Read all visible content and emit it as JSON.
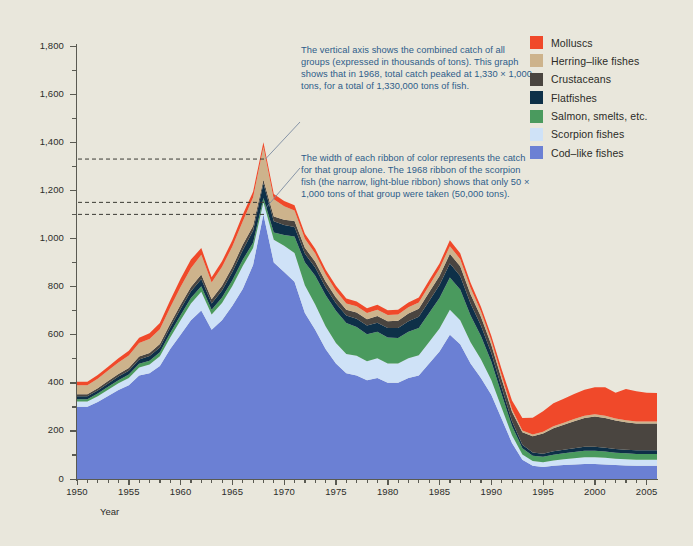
{
  "chart_data": {
    "type": "area",
    "stacked": true,
    "title": "",
    "xlabel": "Year",
    "ylabel": "Catch (tons x 1,000)",
    "xlim": [
      1950,
      2006
    ],
    "ylim": [
      0,
      1800
    ],
    "ytick_labels": [
      "0",
      "200",
      "400",
      "600",
      "800",
      "1,000",
      "1,200",
      "1,400",
      "1,600",
      "1,800"
    ],
    "yticks": [
      0,
      200,
      400,
      600,
      800,
      1000,
      1200,
      1400,
      1600,
      1800
    ],
    "xtick_labels": [
      "1950",
      "1955",
      "1960",
      "1965",
      "1970",
      "1975",
      "1980",
      "1985",
      "1990",
      "1995",
      "2000",
      "2005"
    ],
    "xticks": [
      1950,
      1955,
      1960,
      1965,
      1970,
      1975,
      1980,
      1985,
      1990,
      1995,
      2000,
      2005
    ],
    "grid": false,
    "legend_position": "right",
    "x": [
      1950,
      1951,
      1952,
      1953,
      1954,
      1955,
      1956,
      1957,
      1958,
      1959,
      1960,
      1961,
      1962,
      1963,
      1964,
      1965,
      1966,
      1967,
      1968,
      1969,
      1970,
      1971,
      1972,
      1973,
      1974,
      1975,
      1976,
      1977,
      1978,
      1979,
      1980,
      1981,
      1982,
      1983,
      1984,
      1985,
      1986,
      1987,
      1988,
      1989,
      1990,
      1991,
      1992,
      1993,
      1994,
      1995,
      1996,
      1997,
      1998,
      1999,
      2000,
      2001,
      2002,
      2003,
      2004,
      2005,
      2006
    ],
    "series": [
      {
        "name": "Cod-like fishes",
        "color": "#6b80d4",
        "values": [
          300,
          300,
          320,
          345,
          370,
          390,
          430,
          440,
          470,
          540,
          600,
          660,
          700,
          620,
          660,
          720,
          790,
          890,
          1100,
          900,
          860,
          820,
          690,
          620,
          540,
          480,
          440,
          430,
          410,
          420,
          400,
          400,
          420,
          430,
          480,
          530,
          600,
          560,
          480,
          420,
          350,
          250,
          150,
          80,
          55,
          50,
          55,
          58,
          60,
          62,
          62,
          60,
          58,
          56,
          55,
          55,
          55
        ]
      },
      {
        "name": "Scorpion fishes",
        "color": "#cfe2f7",
        "values": [
          22,
          22,
          24,
          26,
          28,
          30,
          34,
          36,
          40,
          48,
          60,
          70,
          78,
          64,
          72,
          82,
          95,
          70,
          50,
          95,
          110,
          120,
          115,
          105,
          95,
          85,
          80,
          82,
          80,
          82,
          80,
          80,
          82,
          84,
          90,
          96,
          104,
          100,
          88,
          78,
          62,
          46,
          32,
          22,
          20,
          20,
          22,
          24,
          26,
          28,
          28,
          28,
          26,
          26,
          25,
          25,
          25
        ]
      },
      {
        "name": "Salmon, smelts, etc.",
        "color": "#4a9a5e",
        "values": [
          10,
          10,
          11,
          12,
          13,
          14,
          15,
          16,
          17,
          19,
          21,
          22,
          23,
          20,
          22,
          24,
          26,
          22,
          18,
          30,
          44,
          68,
          96,
          120,
          130,
          134,
          128,
          120,
          112,
          110,
          108,
          106,
          110,
          114,
          120,
          126,
          134,
          128,
          112,
          96,
          76,
          56,
          38,
          26,
          22,
          22,
          24,
          25,
          26,
          27,
          27,
          26,
          25,
          25,
          24,
          24,
          24
        ]
      },
      {
        "name": "Flatfishes",
        "color": "#0e3048",
        "values": [
          12,
          12,
          13,
          14,
          15,
          16,
          18,
          19,
          20,
          23,
          26,
          28,
          30,
          26,
          30,
          34,
          40,
          50,
          60,
          46,
          42,
          40,
          36,
          34,
          32,
          32,
          32,
          34,
          36,
          38,
          40,
          42,
          44,
          46,
          50,
          54,
          58,
          56,
          50,
          44,
          36,
          28,
          20,
          14,
          13,
          13,
          14,
          15,
          16,
          17,
          17,
          16,
          16,
          15,
          15,
          15,
          15
        ]
      },
      {
        "name": "Crustaceans",
        "color": "#4a4540",
        "values": [
          8,
          8,
          9,
          10,
          10,
          11,
          12,
          13,
          14,
          15,
          17,
          18,
          19,
          17,
          19,
          21,
          23,
          20,
          16,
          20,
          22,
          24,
          24,
          24,
          24,
          24,
          24,
          26,
          26,
          28,
          28,
          30,
          32,
          34,
          36,
          38,
          40,
          40,
          38,
          36,
          34,
          36,
          40,
          52,
          68,
          84,
          96,
          104,
          112,
          120,
          126,
          124,
          118,
          114,
          112,
          112,
          112
        ]
      },
      {
        "name": "Herring-like fishes",
        "color": "#cdb38c",
        "values": [
          38,
          38,
          40,
          44,
          48,
          52,
          56,
          58,
          62,
          68,
          74,
          78,
          82,
          70,
          78,
          86,
          96,
          118,
          136,
          72,
          56,
          44,
          38,
          34,
          30,
          28,
          26,
          26,
          26,
          26,
          26,
          26,
          26,
          26,
          28,
          30,
          32,
          30,
          26,
          22,
          18,
          14,
          10,
          8,
          7,
          7,
          8,
          8,
          9,
          9,
          9,
          9,
          8,
          8,
          8,
          8,
          8
        ]
      },
      {
        "name": "Molluscs",
        "color": "#f0492a",
        "values": [
          14,
          14,
          15,
          16,
          18,
          20,
          22,
          24,
          26,
          30,
          34,
          36,
          28,
          22,
          24,
          26,
          28,
          24,
          20,
          22,
          22,
          22,
          20,
          20,
          20,
          20,
          20,
          20,
          20,
          20,
          20,
          20,
          20,
          20,
          22,
          22,
          24,
          24,
          22,
          20,
          20,
          26,
          36,
          52,
          70,
          86,
          96,
          100,
          104,
          108,
          112,
          118,
          108,
          130,
          126,
          120,
          118
        ]
      }
    ],
    "annotations": [
      {
        "id": "annotation-1",
        "text": "The vertical axis shows the combined catch of all groups (expressed in thousands of tons). This graph shows that in 1968, total catch peaked at 1,330 × 1,000 tons, for a total of 1,330,000 tons of fish.",
        "points_to_year": 1968,
        "points_to_value": 1330
      },
      {
        "id": "annotation-2",
        "text": "The width of each ribbon of color represents the catch for that group alone. The 1968 ribbon of the scorpion fish (the narrow, light-blue ribbon) shows that only 50 × 1,000 tons of that group were taken (50,000 tons).",
        "points_to_year": 1968,
        "points_to_value": 1125
      }
    ],
    "guide_lines": [
      {
        "value": 1330,
        "label": "total-catch-1968"
      },
      {
        "value": 1150,
        "label": "scorpion-top-1968"
      },
      {
        "value": 1100,
        "label": "cod-top-1968"
      }
    ]
  },
  "legend": {
    "items": [
      {
        "label": "Molluscs",
        "color": "#f0492a"
      },
      {
        "label": "Herring–like fishes",
        "color": "#cdb38c"
      },
      {
        "label": "Crustaceans",
        "color": "#4a4540"
      },
      {
        "label": "Flatfishes",
        "color": "#0e3048"
      },
      {
        "label": "Salmon, smelts, etc.",
        "color": "#4a9a5e"
      },
      {
        "label": "Scorpion fishes",
        "color": "#cfe2f7"
      },
      {
        "label": "Cod–like fishes",
        "color": "#6b80d4"
      }
    ]
  },
  "axes": {
    "y_title": "Catch (tons x 1,000)",
    "x_title": "Year"
  },
  "theme": {
    "background": "#e9e7dc",
    "axis_color": "#5a5a52",
    "text_color": "#2d2d2a",
    "annotation_color": "#2e5d8a"
  }
}
